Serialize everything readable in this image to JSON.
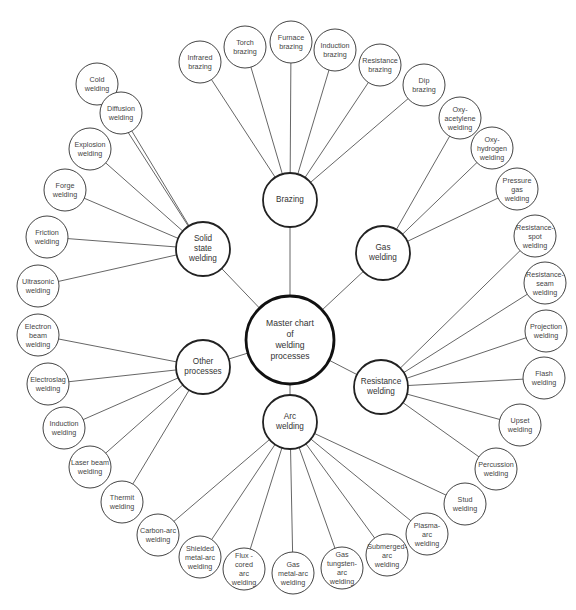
{
  "diagram": {
    "title": "Master chart of welding processes",
    "master": {
      "id": "master",
      "label": "Master chart\nof\nwelding\nprocesses",
      "x": 290,
      "y": 340,
      "r": 44
    },
    "categories": [
      {
        "id": "brazing",
        "label": "Brazing",
        "x": 290,
        "y": 200,
        "r": 27
      },
      {
        "id": "gas",
        "label": "Gas\nwelding",
        "x": 383,
        "y": 253,
        "r": 27
      },
      {
        "id": "resistance",
        "label": "Resistance\nwelding",
        "x": 381,
        "y": 387,
        "r": 27
      },
      {
        "id": "arc",
        "label": "Arc\nwelding",
        "x": 290,
        "y": 422,
        "r": 27
      },
      {
        "id": "other",
        "label": "Other\nprocesses",
        "x": 203,
        "y": 367,
        "r": 27
      },
      {
        "id": "solid",
        "label": "Solid\nstate\nwelding",
        "x": 203,
        "y": 249,
        "r": 27
      }
    ],
    "processes": [
      {
        "id": "cold-welding",
        "parent": "solid",
        "label": "Cold\nwelding",
        "x": 97,
        "y": 84
      },
      {
        "id": "infrared-brazing",
        "parent": "brazing",
        "label": "Infrared\nbrazing",
        "x": 200,
        "y": 62
      },
      {
        "id": "torch-brazing",
        "parent": "brazing",
        "label": "Torch\nbrazing",
        "x": 245,
        "y": 47
      },
      {
        "id": "furnace-brazing",
        "parent": "brazing",
        "label": "Furnace\nbrazing",
        "x": 291,
        "y": 42
      },
      {
        "id": "induction-brazing",
        "parent": "brazing",
        "label": "Induction\nbrazing",
        "x": 335,
        "y": 50
      },
      {
        "id": "resistance-brazing",
        "parent": "brazing",
        "label": "Resistance\nbrazing",
        "x": 380,
        "y": 65
      },
      {
        "id": "dip-brazing",
        "parent": "brazing",
        "label": "Dip\nbrazing",
        "x": 424,
        "y": 85
      },
      {
        "id": "oxy-acetylene-welding",
        "parent": "gas",
        "label": "Oxy-\nacetylene\nwelding",
        "x": 460,
        "y": 118
      },
      {
        "id": "oxy-hydrogen-welding",
        "parent": "gas",
        "label": "Oxy-\nhydrogen\nwelding",
        "x": 492,
        "y": 148
      },
      {
        "id": "pressure-gas-welding",
        "parent": "gas",
        "label": "Pressure\ngas\nwelding",
        "x": 517,
        "y": 189
      },
      {
        "id": "resistance-spot-welding",
        "parent": "resistance",
        "label": "Resistance-\nspot\nwelding",
        "x": 535,
        "y": 236
      },
      {
        "id": "resistance-seam-welding",
        "parent": "resistance",
        "label": "Resistance-\nseam\nwelding",
        "x": 545,
        "y": 283
      },
      {
        "id": "projection-welding",
        "parent": "resistance",
        "label": "Projection\nwelding",
        "x": 546,
        "y": 331
      },
      {
        "id": "flash-welding",
        "parent": "resistance",
        "label": "Flash\nwelding",
        "x": 544,
        "y": 378
      },
      {
        "id": "upset-welding",
        "parent": "resistance",
        "label": "Upset\nwelding",
        "x": 520,
        "y": 425
      },
      {
        "id": "percussion-welding",
        "parent": "resistance",
        "label": "Percussion\nwelding",
        "x": 496,
        "y": 469
      },
      {
        "id": "stud-welding",
        "parent": "arc",
        "label": "Stud\nwelding",
        "x": 465,
        "y": 504
      },
      {
        "id": "plasma-arc-welding",
        "parent": "arc",
        "label": "Plasma-\narc\nwelding",
        "x": 427,
        "y": 534
      },
      {
        "id": "submerged-arc-welding",
        "parent": "arc",
        "label": "Submerged-\narc\nwelding",
        "x": 387,
        "y": 555
      },
      {
        "id": "gas-tungsten-arc-welding",
        "parent": "arc",
        "label": "Gas\ntungsten-\narc\nwelding",
        "x": 342,
        "y": 568
      },
      {
        "id": "gas-metal-arc-welding",
        "parent": "arc",
        "label": "Gas\nmetal-arc\nwelding",
        "x": 293,
        "y": 573
      },
      {
        "id": "flux-cored-arc-welding",
        "parent": "arc",
        "label": "Flux -\ncored\narc\nwelding",
        "x": 244,
        "y": 569
      },
      {
        "id": "shielded-metal-arc-welding",
        "parent": "arc",
        "label": "Shielded\nmetal-arc\nwelding",
        "x": 200,
        "y": 557
      },
      {
        "id": "carbon-arc-welding",
        "parent": "arc",
        "label": "Carbon-arc\nwelding",
        "x": 158,
        "y": 535
      },
      {
        "id": "thermit-welding",
        "parent": "other",
        "label": "Thermit\nwelding",
        "x": 122,
        "y": 502
      },
      {
        "id": "laser-beam-welding",
        "parent": "other",
        "label": "Laser beam\nwelding",
        "x": 90,
        "y": 467
      },
      {
        "id": "induction-welding",
        "parent": "other",
        "label": "Induction\nwelding",
        "x": 64,
        "y": 428
      },
      {
        "id": "electroslag-welding",
        "parent": "other",
        "label": "Electroslag\nwelding",
        "x": 48,
        "y": 384
      },
      {
        "id": "electron-beam-welding",
        "parent": "other",
        "label": "Electron\nbeam\nwelding",
        "x": 38,
        "y": 335
      },
      {
        "id": "ultrasonic-welding",
        "parent": "solid",
        "label": "Ultrasonic\nwelding",
        "x": 38,
        "y": 286
      },
      {
        "id": "friction-welding",
        "parent": "solid",
        "label": "Friction\nwelding",
        "x": 47,
        "y": 237
      },
      {
        "id": "forge-welding",
        "parent": "solid",
        "label": "Forge\nwelding",
        "x": 65,
        "y": 190
      },
      {
        "id": "explosion-welding",
        "parent": "solid",
        "label": "Explosion\nwelding",
        "x": 90,
        "y": 149
      },
      {
        "id": "diffusion-welding",
        "parent": "solid",
        "label": "Diffusion\nwelding",
        "x": 121,
        "y": 113
      }
    ],
    "outer_radius": 21,
    "colors": {
      "stroke": "#333333",
      "text": "#444444",
      "background": "#ffffff"
    }
  }
}
